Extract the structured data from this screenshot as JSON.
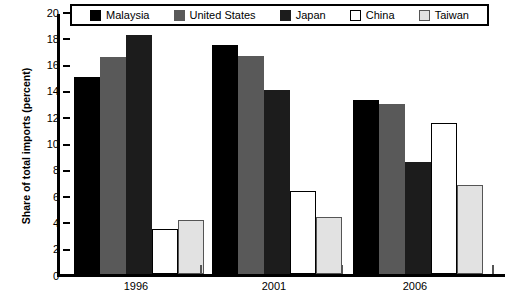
{
  "chart_data": {
    "type": "bar",
    "title": "",
    "xlabel": "",
    "ylabel": "Share of total imports (percent)",
    "categories": [
      "1996",
      "2001",
      "2006"
    ],
    "ylim": [
      0,
      20
    ],
    "ytick_step": 2,
    "yticks": [
      "0",
      "2",
      "4",
      "6",
      "8",
      "10",
      "12",
      "14",
      "16",
      "18",
      "20"
    ],
    "grid": false,
    "legend_position": "top",
    "series": [
      {
        "name": "Malaysia",
        "color": "#000000",
        "values": [
          15.0,
          17.4,
          13.2
        ]
      },
      {
        "name": "United States",
        "color": "#595959",
        "values": [
          16.5,
          16.6,
          12.9
        ]
      },
      {
        "name": "Japan",
        "color": "#1c1c1c",
        "values": [
          18.2,
          14.0,
          8.5
        ]
      },
      {
        "name": "China",
        "color": "#ffffff",
        "values": [
          3.4,
          6.3,
          11.5
        ]
      },
      {
        "name": "Taiwan",
        "color": "#e2e2e2",
        "values": [
          4.1,
          4.3,
          6.8
        ]
      }
    ]
  }
}
